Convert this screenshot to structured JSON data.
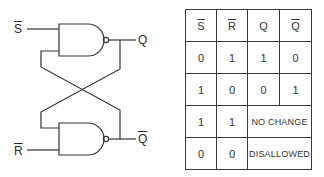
{
  "circuit": {
    "title": "SR latch using NAND gates",
    "inputs": {
      "top": "S",
      "bottom": "R"
    },
    "outputs": {
      "top": "Q",
      "bottom": "Q"
    },
    "input_top_overline": true,
    "input_bottom_overline": true,
    "output_bottom_overline": true,
    "gates": [
      "NAND",
      "NAND"
    ]
  },
  "truth_table": {
    "headers": [
      "S",
      "R",
      "Q",
      "Q"
    ],
    "rows": [
      [
        "0",
        "1",
        "1",
        "0"
      ],
      [
        "1",
        "0",
        "0",
        "1"
      ],
      [
        "1",
        "1",
        "NO CHANGE"
      ],
      [
        "0",
        "0",
        "DISALLOWED"
      ]
    ]
  }
}
